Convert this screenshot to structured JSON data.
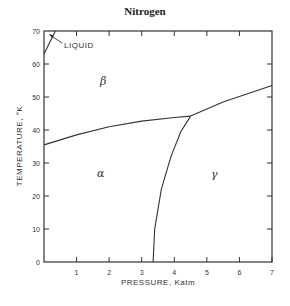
{
  "chart_data": {
    "type": "line",
    "title": "Nitrogen",
    "xlabel": "PRESSURE, Katm",
    "ylabel": "TEMPERATURE, °K",
    "xlim": [
      0,
      7
    ],
    "ylim": [
      0,
      70
    ],
    "x_ticks": [
      "0",
      "1",
      "2",
      "3",
      "4",
      "5",
      "6",
      "7"
    ],
    "x_tick_labels_shown": [
      "1",
      "2",
      "3",
      "4",
      "5",
      "6",
      "7"
    ],
    "y_ticks": [
      "0",
      "10",
      "20",
      "30",
      "40",
      "50",
      "60",
      "70"
    ],
    "grid": false,
    "regions": [
      {
        "name": "β",
        "x": 1.7,
        "y": 55
      },
      {
        "name": "α",
        "x": 1.75,
        "y": 27
      },
      {
        "name": "γ",
        "x": 5.25,
        "y": 27
      }
    ],
    "annotations": [
      {
        "text": "LIQUID",
        "x": 0.7,
        "y": 66,
        "arrow_to": [
          0.15,
          68.5
        ]
      }
    ],
    "series": [
      {
        "name": "liquid-beta boundary",
        "x": [
          0.0,
          0.35
        ],
        "y": [
          63,
          70
        ]
      },
      {
        "name": "alpha-beta boundary",
        "x": [
          0.0,
          1.0,
          2.0,
          3.0,
          4.0,
          4.5
        ],
        "y": [
          35.5,
          38.5,
          41,
          42.7,
          43.8,
          44.2
        ]
      },
      {
        "name": "beta-gamma boundary",
        "x": [
          4.5,
          5.5,
          6.5,
          7.0
        ],
        "y": [
          44.2,
          48.5,
          51.8,
          53.5
        ]
      },
      {
        "name": "alpha-gamma boundary",
        "x": [
          3.35,
          3.4,
          3.6,
          3.9,
          4.2,
          4.5
        ],
        "y": [
          0,
          10,
          22,
          32,
          39.5,
          44.2
        ]
      }
    ],
    "triple_point": {
      "x": 4.5,
      "y": 44.2
    }
  }
}
